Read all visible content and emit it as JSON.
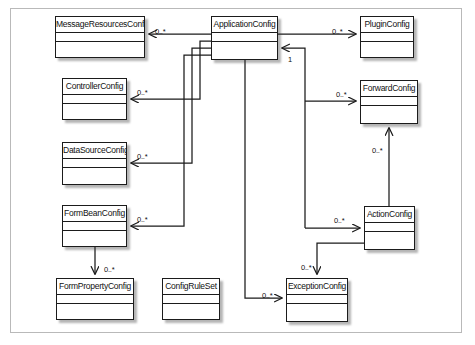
{
  "diagram": {
    "kind": "uml-class-diagram",
    "frame": {
      "border_color": "#b9b9b9",
      "background": "#ffffff"
    },
    "style": {
      "box_border": "#1b1b1b",
      "line_color": "#1b1b1b",
      "text_color": "#111111"
    },
    "classes": [
      {
        "id": "message-resources-config",
        "name": "MessageResourcesConfig",
        "x": 55,
        "y": 16,
        "w": 90,
        "h": 42
      },
      {
        "id": "application-config",
        "name": "ApplicationConfig",
        "x": 211,
        "y": 16,
        "w": 67,
        "h": 44
      },
      {
        "id": "plugin-config",
        "name": "PluginConfig",
        "x": 360,
        "y": 16,
        "w": 54,
        "h": 42
      },
      {
        "id": "controller-config",
        "name": "ControllerConfig",
        "x": 62,
        "y": 78,
        "w": 65,
        "h": 42
      },
      {
        "id": "forward-config",
        "name": "ForwardConfig",
        "x": 360,
        "y": 80,
        "w": 58,
        "h": 44
      },
      {
        "id": "data-source-config",
        "name": "DataSourceConfig",
        "x": 62,
        "y": 142,
        "w": 65,
        "h": 43
      },
      {
        "id": "form-bean-config",
        "name": "FormBeanConfig",
        "x": 62,
        "y": 205,
        "w": 65,
        "h": 42
      },
      {
        "id": "action-config",
        "name": "ActionConfig",
        "x": 364,
        "y": 206,
        "w": 51,
        "h": 44
      },
      {
        "id": "form-property-config",
        "name": "FormPropertyConfig",
        "x": 56,
        "y": 278,
        "w": 78,
        "h": 42
      },
      {
        "id": "config-rule-set",
        "name": "ConfigRuleSet",
        "x": 162,
        "y": 278,
        "w": 58,
        "h": 42
      },
      {
        "id": "exception-config",
        "name": "ExceptionConfig",
        "x": 286,
        "y": 278,
        "w": 62,
        "h": 44
      }
    ],
    "associations": [
      {
        "id": "appcfg-to-messageresources",
        "from": "application-config",
        "to": "message-resources-config",
        "multiplicity": "0..*",
        "label_x": 155,
        "label_y": 27
      },
      {
        "id": "appcfg-to-controller",
        "from": "application-config",
        "to": "controller-config",
        "multiplicity": "0..*",
        "label_x": 137,
        "label_y": 88
      },
      {
        "id": "appcfg-to-datasource",
        "from": "application-config",
        "to": "data-source-config",
        "multiplicity": "0..*",
        "label_x": 137,
        "label_y": 152
      },
      {
        "id": "appcfg-to-formbean",
        "from": "application-config",
        "to": "form-bean-config",
        "multiplicity": "0..*",
        "label_x": 137,
        "label_y": 215
      },
      {
        "id": "appcfg-to-plugin",
        "from": "application-config",
        "to": "plugin-config",
        "multiplicity": "0..*",
        "label_x": 332,
        "label_y": 27
      },
      {
        "id": "appcfg-to-forward",
        "from": "application-config",
        "to": "forward-config",
        "multiplicity": "0..*",
        "label_x": 336,
        "label_y": 90
      },
      {
        "id": "appcfg-to-action",
        "from": "application-config",
        "to": "action-config",
        "multiplicity": "0..*",
        "label_x": 334,
        "label_y": 216
      },
      {
        "id": "appcfg-to-exception",
        "from": "application-config",
        "to": "exception-config",
        "multiplicity": "0..*",
        "label_x": 262,
        "label_y": 291
      },
      {
        "id": "action-to-appcfg",
        "from": "action-config",
        "to": "application-config",
        "multiplicity": "1",
        "label_x": 288,
        "label_y": 55
      },
      {
        "id": "action-to-forward",
        "from": "action-config",
        "to": "forward-config",
        "multiplicity": "0..*",
        "label_x": 372,
        "label_y": 146
      },
      {
        "id": "action-to-exception",
        "from": "action-config",
        "to": "exception-config",
        "multiplicity": "0..*",
        "label_x": 301,
        "label_y": 263
      },
      {
        "id": "formbean-to-formproperty",
        "from": "form-bean-config",
        "to": "form-property-config",
        "multiplicity": "0..*",
        "label_x": 104,
        "label_y": 265
      }
    ]
  }
}
